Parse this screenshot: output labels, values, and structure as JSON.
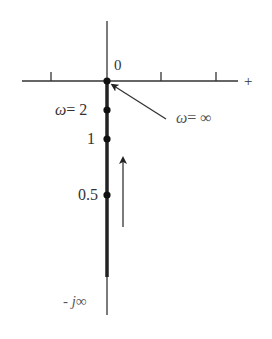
{
  "diagram": {
    "type": "polar-plot",
    "axes": {
      "origin_label": "0",
      "positive_real_label": "+",
      "negative_imag_label_prefix": "- ",
      "negative_imag_label_j": "j",
      "negative_imag_label_inf": "∞"
    },
    "points": [
      {
        "label_omega": "ω",
        "label_eq": "= 2",
        "omega": 2
      },
      {
        "label": "1",
        "omega": 1
      },
      {
        "label": "0.5",
        "omega": 0.5
      }
    ],
    "annotation": {
      "omega": "ω",
      "eq": "= ∞"
    },
    "direction_arrow": "up",
    "colors": {
      "line": "#222222",
      "text": "#333333"
    }
  }
}
